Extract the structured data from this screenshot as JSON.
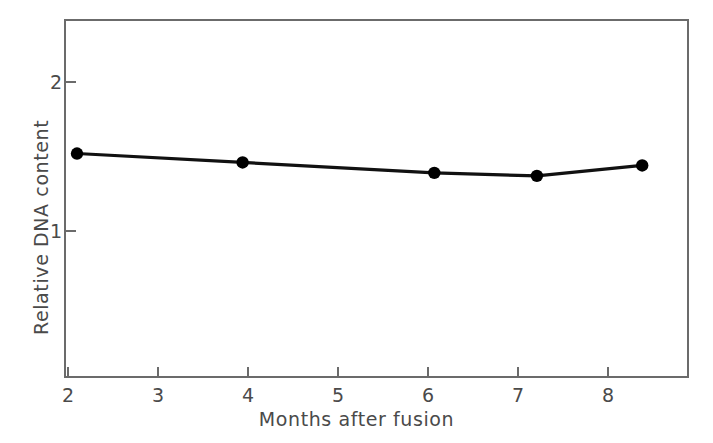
{
  "chart_data": {
    "type": "line",
    "title": "",
    "subtitle": "",
    "xlabel": "Months after fusion",
    "ylabel": "Relative DNA content",
    "xlim": [
      1.72,
      8.89
    ],
    "ylim": [
      0.02,
      2.4
    ],
    "grid": false,
    "legend": null,
    "xticks": [
      2,
      3,
      4,
      5,
      6,
      7,
      8
    ],
    "xtick_labels": [
      "2",
      "3",
      "4",
      "5",
      "6",
      "7",
      "8"
    ],
    "yticks": [
      1,
      2
    ],
    "ytick_labels": [
      "1",
      "2"
    ],
    "series": [
      {
        "name": "Relative DNA content",
        "marker": "filled-circle",
        "color": "#000000",
        "x": [
          2.1,
          3.94,
          6.07,
          7.21,
          8.38
        ],
        "y": [
          1.52,
          1.46,
          1.39,
          1.37,
          1.44
        ]
      }
    ],
    "annotations": []
  },
  "axes": {
    "x_title": "Months after fusion",
    "y_title": "Relative DNA content"
  },
  "style": {
    "line_color": "#111111",
    "marker_color": "#000000",
    "frame_color": "#6b6b6b",
    "text_color": "#4a4a4a",
    "background": "#ffffff"
  }
}
